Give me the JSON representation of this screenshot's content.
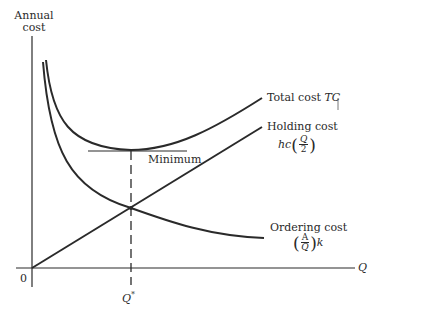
{
  "diagram": {
    "y_axis_label_line1": "Annual",
    "y_axis_label_line2": "cost",
    "x_axis_label": "Q",
    "origin_label": "0",
    "optimum_label": "Q*",
    "optimum_symbol": "Q",
    "optimum_star": "*",
    "minimum_label": "Minimum",
    "curves": {
      "total": {
        "name": "Total cost",
        "symbol": "TC"
      },
      "holding": {
        "name": "Holding cost",
        "formula_prefix": "hc",
        "num": "Q",
        "den": "2",
        "open": "(",
        "close": ")"
      },
      "ordering": {
        "name": "Ordering cost",
        "num": "A",
        "den": "Q",
        "suffix": "k",
        "open": "(",
        "close": ")"
      }
    },
    "colors": {
      "ink": "#2a2a2a",
      "background": "#ffffff"
    }
  }
}
